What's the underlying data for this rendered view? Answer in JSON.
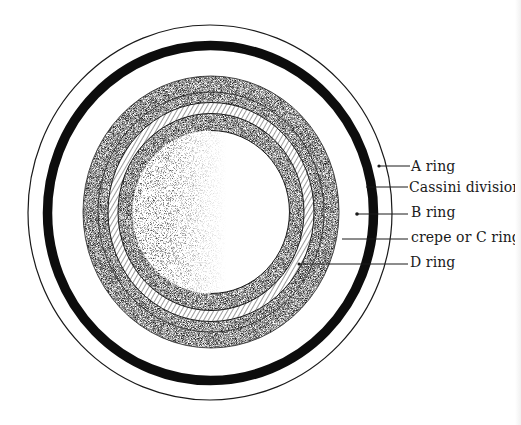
{
  "diagram": {
    "colors": {
      "ink": "#111111",
      "background": "#ffffff",
      "stipple_dark": "#2a2a2a",
      "hatch": "#3a3a3a"
    },
    "labels": [
      {
        "id": "a-ring",
        "text": "A ring"
      },
      {
        "id": "cassini-division",
        "text": "Cassini division"
      },
      {
        "id": "b-ring",
        "text": "B ring"
      },
      {
        "id": "c-ring",
        "text": "crepe or C ring"
      },
      {
        "id": "d-ring",
        "text": "D ring"
      }
    ]
  }
}
